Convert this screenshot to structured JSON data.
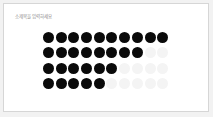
{
  "slide": {
    "subtitle": "소제목을 입력하세요"
  },
  "dot_rows": [
    {
      "filled": 10,
      "total": 10
    },
    {
      "filled": 8,
      "total": 10
    },
    {
      "filled": 6,
      "total": 10
    },
    {
      "filled": 5,
      "total": 10
    }
  ],
  "colors": {
    "filled": "#0a0a0a",
    "empty": "#f4f4f4"
  }
}
